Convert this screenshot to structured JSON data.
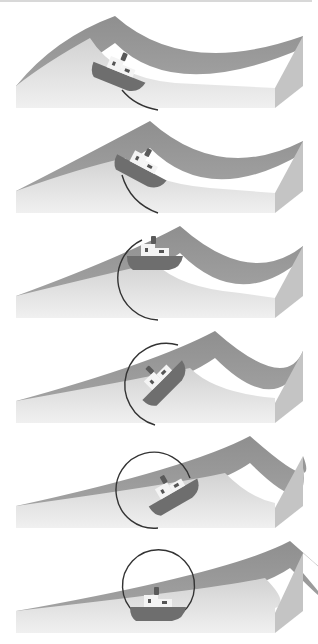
{
  "diagram": {
    "colors": {
      "wave_surface": "#8f8f8f",
      "wave_surface_light": "#a8a8a8",
      "block_front": "#e6e6e6",
      "block_side": "#c4c4c4",
      "hull": "#6e6e6e",
      "cabin": "#f4f4f4",
      "window": "#555555",
      "funnel": "#5a5a5a",
      "arrow": "#333333",
      "top_rule": "#d8d8d8"
    },
    "panels": [
      {
        "step": 1,
        "top": 8,
        "crest_x": 115,
        "boat": {
          "x": 118,
          "y": 68,
          "angle": 22
        },
        "arrow": "small-arc-up-left"
      },
      {
        "step": 2,
        "top": 113,
        "crest_x": 150,
        "boat": {
          "x": 140,
          "y": 58,
          "angle": 28
        },
        "arrow": "arc-up"
      },
      {
        "step": 3,
        "top": 218,
        "crest_x": 180,
        "boat": {
          "x": 155,
          "y": 42,
          "angle": 0
        },
        "arrow": "half-circle-left"
      },
      {
        "step": 4,
        "top": 323,
        "crest_x": 215,
        "boat": {
          "x": 165,
          "y": 60,
          "angle": -45
        },
        "arrow": "three-quarter-circle"
      },
      {
        "step": 5,
        "top": 428,
        "crest_x": 250,
        "boat": {
          "x": 175,
          "y": 68,
          "angle": -30
        },
        "arrow": "near-full-circle"
      },
      {
        "step": 6,
        "top": 533,
        "crest_x": 290,
        "boat": {
          "x": 158,
          "y": 78,
          "angle": 0
        },
        "arrow": "full-circle"
      }
    ]
  }
}
